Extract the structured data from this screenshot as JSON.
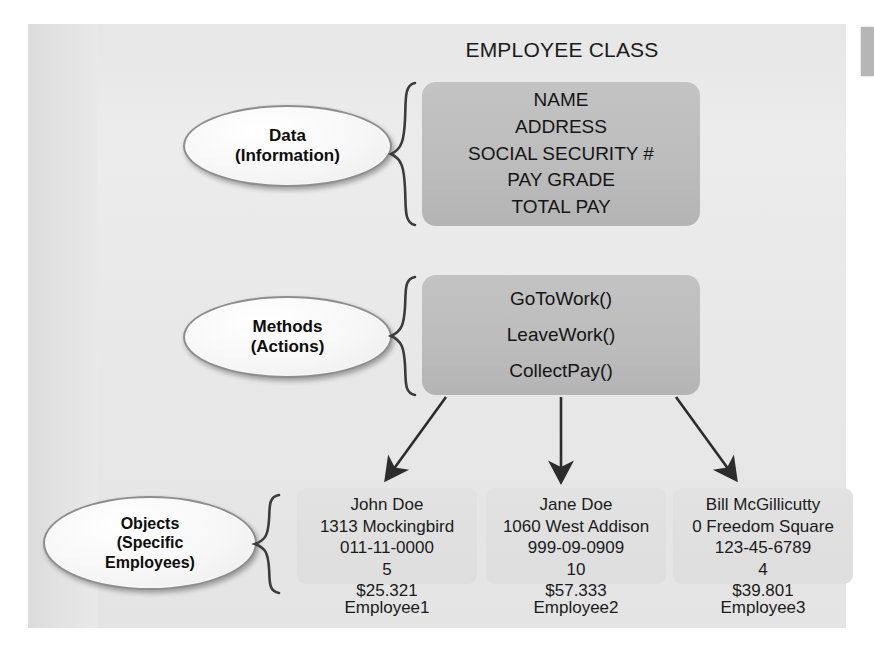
{
  "diagram": {
    "title": "EMPLOYEE CLASS",
    "callouts": [
      {
        "name": "data",
        "line1": "Data",
        "line2": "(Information)"
      },
      {
        "name": "methods",
        "line1": "Methods",
        "line2": "(Actions)"
      },
      {
        "name": "objects",
        "line1": "Objects",
        "line2": "(Specific",
        "line3": "Employees)"
      }
    ],
    "data_members": [
      "NAME",
      "ADDRESS",
      "SOCIAL SECURITY #",
      "PAY GRADE",
      "TOTAL PAY"
    ],
    "method_members": [
      "GoToWork()",
      "LeaveWork()",
      "CollectPay()"
    ],
    "objects": [
      {
        "label": "Employee1",
        "name": "John Doe",
        "address": "1313 Mockingbird",
        "ssn": "011-11-0000",
        "pay_grade": "5",
        "total_pay": "$25.321"
      },
      {
        "label": "Employee2",
        "name": "Jane Doe",
        "address": "1060 West Addison",
        "ssn": "999-09-0909",
        "pay_grade": "10",
        "total_pay": "$57.333"
      },
      {
        "label": "Bill McGillicutty-placeholder",
        "name": "Bill McGillicutty",
        "address": "0 Freedom Square",
        "ssn": "123-45-6789",
        "pay_grade": "4",
        "total_pay": "$39.801"
      }
    ],
    "object_labels": [
      "Employee1",
      "Employee2",
      "Employee3"
    ],
    "colors": {
      "paper": "#e9e9e9",
      "member_box": "#bdbdbd",
      "object_card": "#e0e0e0",
      "ink": "#151515",
      "callout_fill": "#fbfbfb",
      "callout_stroke": "#8e8e8e"
    },
    "icons": {
      "brace": "curly-brace",
      "arrow": "arrow-down"
    }
  }
}
